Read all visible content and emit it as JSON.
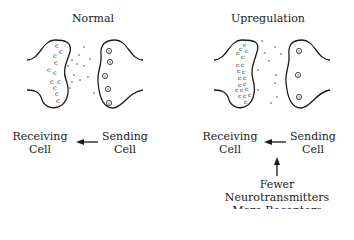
{
  "panels": [
    {
      "title": "Normal",
      "receiving_label": [
        "Receiving",
        "Cell"
      ],
      "sending_label": [
        "Sending",
        "Cell"
      ],
      "receptor_glyph": "c",
      "receptor_count": 13,
      "neurotransmitter_count": 5,
      "annotation": null
    },
    {
      "title": "Upregulation",
      "receiving_label": [
        "Receiving",
        "Cell"
      ],
      "sending_label": [
        "Sending",
        "Cell"
      ],
      "receptor_glyph": "c",
      "receptor_count": 22,
      "neurotransmitter_count": 3,
      "annotation": [
        "Fewer Neurotransmitters",
        "More Receptors"
      ]
    }
  ],
  "colors": {
    "stroke": "#1a1a1a",
    "background": "#ffffff"
  }
}
